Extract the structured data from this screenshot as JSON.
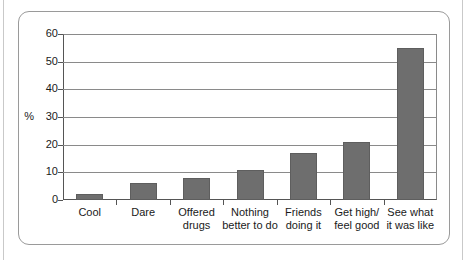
{
  "chart_data": {
    "type": "bar",
    "title": "",
    "xlabel": "",
    "ylabel": "%",
    "ylim": [
      0,
      60
    ],
    "yticks": [
      0,
      10,
      20,
      30,
      40,
      50,
      60
    ],
    "grid": true,
    "legend": "none",
    "bar_color": "#6e6e6e",
    "categories": [
      "Cool",
      "Dare",
      "Offered drugs",
      "Nothing better to do",
      "Friends doing it",
      "Get high/ feel good",
      "See what it was like"
    ],
    "category_lines": [
      [
        "Cool",
        ""
      ],
      [
        "Dare",
        ""
      ],
      [
        "Offered",
        "drugs"
      ],
      [
        "Nothing",
        "better to do"
      ],
      [
        "Friends",
        "doing it"
      ],
      [
        "Get high/",
        "feel good"
      ],
      [
        "See what",
        "it was like"
      ]
    ],
    "values": [
      2,
      6,
      8,
      11,
      17,
      21,
      55
    ]
  },
  "axis": {
    "unit_label": "%",
    "tick_labels": [
      "0",
      "10",
      "20",
      "30",
      "40",
      "50",
      "60"
    ]
  }
}
